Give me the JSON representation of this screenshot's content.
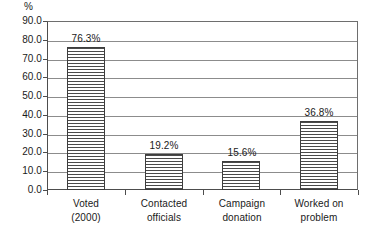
{
  "chart_data": {
    "type": "bar",
    "title": "",
    "xlabel": "",
    "ylabel": "%",
    "unit_label": "%",
    "categories": [
      "Voted\n(2000)",
      "Contacted\nofficials",
      "Campaign\ndonation",
      "Worked on\nproblem"
    ],
    "category_lines": [
      [
        "Voted",
        "(2000)"
      ],
      [
        "Contacted",
        "officials"
      ],
      [
        "Campaign",
        "donation"
      ],
      [
        "Worked on",
        "problem"
      ]
    ],
    "values": [
      76.3,
      19.2,
      15.6,
      36.8
    ],
    "data_labels": [
      "76.3%",
      "19.2%",
      "15.6%",
      "36.8%"
    ],
    "ylim": [
      0.0,
      90.0
    ],
    "ytick_step": 10.0,
    "ytick_labels": [
      "90.0",
      "80.0",
      "70.0",
      "60.0",
      "50.0",
      "40.0",
      "30.0",
      "20.0",
      "10.0",
      "0.0"
    ],
    "ytick_values": [
      90.0,
      80.0,
      70.0,
      60.0,
      50.0,
      40.0,
      30.0,
      20.0,
      10.0,
      0.0
    ],
    "grid": true,
    "legend": false,
    "legend_position": "none",
    "series": [
      {
        "name": "Participation rate",
        "values": [
          76.3,
          19.2,
          15.6,
          36.8
        ],
        "fill": "horizontal-hatch",
        "fill_color": "#ffffff",
        "hatch_color": "#4a4a4a",
        "border_color": "#3d3d3d"
      }
    ],
    "colors": {
      "axis": "#4d4d4d",
      "grid": "#8c8c8c",
      "text": "#1a1a1a",
      "background": "#ffffff",
      "bar_border": "#3d3d3d",
      "bar_hatch": "#4a4a4a"
    }
  }
}
